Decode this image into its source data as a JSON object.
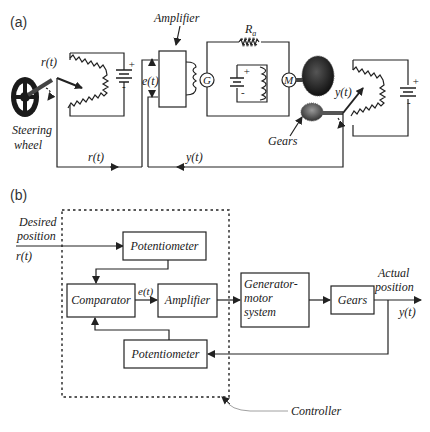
{
  "panel_a": {
    "label": "(a)",
    "labels": {
      "amplifier": "Amplifier",
      "ra": "R",
      "ra_sub": "a",
      "r_t_wheel": "r(t)",
      "e_t": "e(t)",
      "y_t_gear": "y(t)",
      "steering_1": "Steering",
      "steering_2": "wheel",
      "gears": "Gears",
      "r_t_bottom": "r(t)",
      "y_t_bottom": "y(t)",
      "generator": "G",
      "motor": "M",
      "plus": "+",
      "minus": "-"
    }
  },
  "panel_b": {
    "label": "(b)",
    "input": {
      "line1": "Desired",
      "line2": "position",
      "signal": "r(t)"
    },
    "output": {
      "line1": "Actual",
      "line2": "position",
      "signal": "y(t)"
    },
    "blocks": {
      "pot_top": "Potentiometer",
      "comparator": "Comparator",
      "amplifier": "Amplifier",
      "genmotor_1": "Generator-",
      "genmotor_2": "motor",
      "genmotor_3": "system",
      "gears": "Gears",
      "pot_bottom": "Potentiometer"
    },
    "error_signal": "e(t)",
    "controller_label": "Controller"
  }
}
